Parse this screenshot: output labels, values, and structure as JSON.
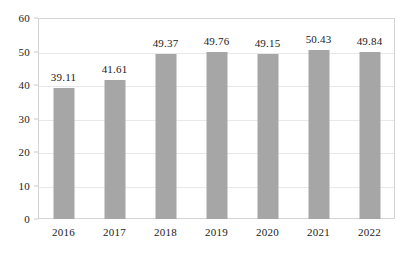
{
  "chart_data": {
    "type": "bar",
    "title": "",
    "subtitle": "",
    "xlabel": "",
    "ylabel": "",
    "categories": [
      "2016",
      "2017",
      "2018",
      "2019",
      "2020",
      "2021",
      "2022"
    ],
    "values": [
      39.11,
      41.61,
      49.37,
      49.76,
      49.15,
      50.43,
      49.84
    ],
    "data_labels": [
      "39.11",
      "41.61",
      "49.37",
      "49.76",
      "49.15",
      "50.43",
      "49.84"
    ],
    "series": [
      {
        "name": "",
        "values": [
          39.11,
          41.61,
          49.37,
          49.76,
          49.15,
          50.43,
          49.84
        ],
        "color": "#a6a6a6"
      }
    ],
    "ylim": [
      0,
      60
    ],
    "ytick_values": [
      60,
      50,
      40,
      30,
      20,
      10,
      0
    ],
    "ytick_labels": [
      "60",
      "50",
      "40",
      "30",
      "20",
      "10",
      "0"
    ],
    "ytick_interval": 10,
    "grid": true,
    "grid_axis": "y",
    "grid_color": "#e8e8e8",
    "legend": false,
    "legend_position": "none",
    "bar_color": "#a6a6a6",
    "plot_border_color": "#d4d4d4",
    "background_color": "#ffffff",
    "text_color": "#222222"
  }
}
